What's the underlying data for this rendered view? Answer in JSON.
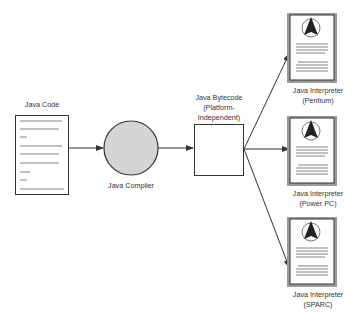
{
  "diagram": {
    "colors": {
      "stroke": "#333333",
      "compiler_fill": "#d4d4d4",
      "doc_shadow": "#9a9a9a",
      "doc_lines": "#666666",
      "text": "#333333"
    },
    "nodes": {
      "source": {
        "label": "Java Code",
        "shape": "document"
      },
      "compiler": {
        "label": "Java Compiler",
        "shape": "circle"
      },
      "bytecode": {
        "label_line1": "Java Bytecode",
        "label_line2": "(Platform-",
        "label_line3": "Independent)",
        "shape": "square"
      },
      "interpreters": [
        {
          "label_line1": "Java Interpreter",
          "label_line2": "(Pentium)",
          "icon": "java-logo-document"
        },
        {
          "label_line1": "Java Interpreter",
          "label_line2": "(Power PC)",
          "icon": "java-logo-document"
        },
        {
          "label_line1": "Java Interpreter",
          "label_line2": "(SPARC)",
          "icon": "java-logo-document"
        }
      ]
    },
    "edges": [
      {
        "from": "Java Code",
        "to": "Java Compiler"
      },
      {
        "from": "Java Compiler",
        "to": "Java Bytecode"
      },
      {
        "from": "Java Bytecode",
        "to": "Java Interpreter (Pentium)"
      },
      {
        "from": "Java Bytecode",
        "to": "Java Interpreter (Power PC)"
      },
      {
        "from": "Java Bytecode",
        "to": "Java Interpreter (SPARC)"
      }
    ]
  }
}
